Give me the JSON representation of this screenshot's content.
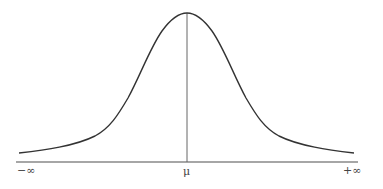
{
  "diagram": {
    "type": "normal-distribution-curve",
    "labels": {
      "left": "−∞",
      "center": "μ",
      "right": "+∞"
    },
    "colors": {
      "curve": "#333333",
      "axis": "#777777",
      "mean_line": "#666666",
      "background": "#ffffff"
    }
  }
}
